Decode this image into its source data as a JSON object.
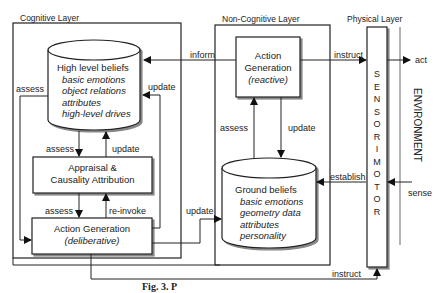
{
  "layers": {
    "cognitive": "Cognitive Layer",
    "non_cognitive": "Non-Cognitive Layer",
    "physical": "Physical Layer"
  },
  "nodes": {
    "high_level_beliefs": {
      "title": "High level beliefs",
      "items": [
        "basic emotions",
        "object relations",
        "attributes",
        "high-level drives"
      ]
    },
    "appraisal": {
      "line1": "Appraisal &",
      "line2": "Causality Attribution"
    },
    "action_gen_deliberative": {
      "title": "Action Generation",
      "subtitle": "(deliberative)"
    },
    "action_gen_reactive": {
      "line1": "Action",
      "line2": "Generation",
      "subtitle": "(reactive)"
    },
    "ground_beliefs": {
      "title": "Ground beliefs",
      "items": [
        "basic emotions",
        "geometry data",
        "attributes",
        "personality"
      ]
    },
    "sensorimotor": {
      "letters": [
        "S",
        "E",
        "N",
        "S",
        "O",
        "R",
        "I",
        "M",
        "O",
        "T",
        "O",
        "R"
      ]
    },
    "environment": "ENVIRONMENT"
  },
  "edges": {
    "inform": "inform",
    "instruct_top": "instruct",
    "act": "act",
    "assess_left": "assess",
    "update_hlb": "update",
    "assess_hlb_appraisal": "assess",
    "update_appraisal_hlb": "update",
    "assess_appraisal_action": "assess",
    "reinvoke": "re-invoke",
    "update_to_ground": "update",
    "assess_nc": "assess",
    "update_nc": "update",
    "establish": "establish",
    "sense": "sense",
    "instruct_bottom": "instruct"
  },
  "caption": "Fig. 3. P"
}
